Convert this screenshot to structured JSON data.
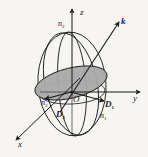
{
  "figure": {
    "background_color": "#f6f5f2",
    "stroke_color": "#1a1a1a",
    "section_fill_color": "#a9a9a9",
    "axes": [
      {
        "name": "z",
        "label": "z",
        "direction": "up"
      },
      {
        "name": "y",
        "label": "y",
        "direction": "right"
      },
      {
        "name": "x",
        "label": "x",
        "direction": "down-left"
      }
    ],
    "vectors": [
      {
        "name": "k",
        "label": "k",
        "direction": "up-right",
        "style": "bold-italic"
      },
      {
        "name": "D1",
        "label": "D",
        "subscript": "1",
        "direction": "lower-right",
        "style": "bold-italic"
      },
      {
        "name": "D2",
        "label": "D",
        "subscript": "2",
        "direction": "lower-left",
        "style": "bold-italic"
      }
    ],
    "indices": [
      {
        "name": "n2",
        "label": "n",
        "subscript": "2",
        "position": "top"
      },
      {
        "name": "n3",
        "label": "n",
        "subscript": "3",
        "position": "left"
      },
      {
        "name": "n1",
        "label": "n",
        "subscript": "1",
        "position": "bottom-right"
      }
    ],
    "origin": {
      "name": "O",
      "label": "O"
    }
  }
}
